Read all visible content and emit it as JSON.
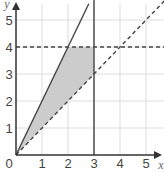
{
  "chart_data": {
    "type": "line",
    "title": "",
    "xlabel": "x",
    "ylabel": "y",
    "xlim": [
      0,
      5.8
    ],
    "ylim": [
      0,
      5.6
    ],
    "grid": true,
    "x_ticks": [
      "0",
      "1",
      "2",
      "3",
      "4",
      "5"
    ],
    "y_ticks": [
      "1",
      "2",
      "3",
      "4",
      "5"
    ],
    "series": [
      {
        "name": "y = 2x",
        "style": "solid",
        "points": [
          [
            0,
            0
          ],
          [
            2.8,
            5.6
          ]
        ]
      },
      {
        "name": "y = x",
        "style": "dashed",
        "points": [
          [
            0,
            0
          ],
          [
            5.8,
            5.8
          ]
        ]
      },
      {
        "name": "y = 4",
        "style": "dashed",
        "points": [
          [
            0,
            4
          ],
          [
            5.8,
            4
          ]
        ]
      },
      {
        "name": "x = 3",
        "style": "solid",
        "points": [
          [
            3,
            0
          ],
          [
            3,
            5.8
          ]
        ]
      }
    ],
    "shaded_region": {
      "description": "region between y=x and y=2x with x<=3 and y<=4",
      "vertices": [
        [
          0,
          0
        ],
        [
          2,
          4
        ],
        [
          3,
          4
        ],
        [
          3,
          3
        ]
      ],
      "color": "#cccccc"
    }
  },
  "colors": {
    "grid": "#dddddd",
    "axis": "#333333",
    "line": "#444444",
    "shade": "#cccccc"
  }
}
